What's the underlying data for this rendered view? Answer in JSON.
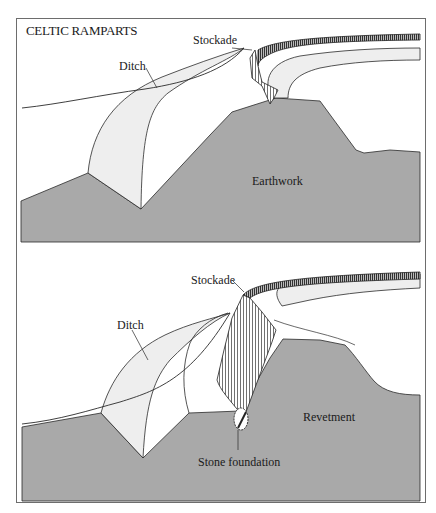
{
  "title": "CELTIC RAMPARTS",
  "panels": [
    {
      "id": "earthwork",
      "labels": {
        "stockade": "Stockade",
        "ditch": "Ditch",
        "main": "Earthwork"
      }
    },
    {
      "id": "revetment",
      "labels": {
        "stockade": "Stockade",
        "ditch": "Ditch",
        "main": "Revetment",
        "foundation": "Stone foundation"
      }
    }
  ],
  "colors": {
    "earth": "#a9a9a9",
    "ditch_fill": "#eeeeee",
    "line": "#2a2a2a",
    "frame": "#6d6d6d",
    "background": "#ffffff"
  }
}
